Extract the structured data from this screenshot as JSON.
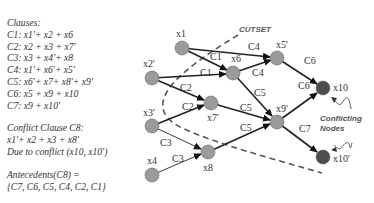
{
  "clauses": {
    "title": "Clauses:",
    "items": [
      "C1: x1'+ x2 + x6",
      "C2: x2 + x3 + x7'",
      "C3: x3 + x4'+ x8",
      "C4: x1'+ x6'+ x5'",
      "C5: x6'+ x7+ x8'+ x9'",
      "C6: x5 + x9 + x10",
      "C7: x9 + x10'"
    ]
  },
  "conflict": {
    "title": "Conflict Clause C8:",
    "clause": "x1'+ x2 + x3 + x8'",
    "reason": "Due to conflict (x10, x10')"
  },
  "antecedents": {
    "title": "Antecedents(C8) =",
    "value": "{C7, C6, C5, C4, C2, C1}"
  },
  "graph": {
    "cutset_label": "CUTSET",
    "conflicting_label_line1": "Conflicting",
    "conflicting_label_line2": "Nodes",
    "colors": {
      "node": "#9a9a9a",
      "conflict_node": "#4d4d4d",
      "edge": "#222222",
      "cutset": "#555555"
    },
    "nodes": [
      {
        "id": "x1",
        "label": "x1"
      },
      {
        "id": "x2p",
        "label": "x2'"
      },
      {
        "id": "x3p",
        "label": "x3'"
      },
      {
        "id": "x4",
        "label": "x4"
      },
      {
        "id": "x6",
        "label": "x6"
      },
      {
        "id": "x7p",
        "label": "x7'"
      },
      {
        "id": "x8",
        "label": "x8"
      },
      {
        "id": "x5p",
        "label": "x5'"
      },
      {
        "id": "x9p",
        "label": "x9'"
      },
      {
        "id": "x10",
        "label": "x10"
      },
      {
        "id": "x10p",
        "label": "x10'"
      }
    ],
    "edge_labels": {
      "x1_x6": "C1",
      "x2_x6": "C1",
      "x1_x5": "C4",
      "x6_x5": "C4",
      "x2_x7": "C2",
      "x3_x7": "C2",
      "x3_x8": "C3",
      "x4_x8": "C3",
      "x6_x9": "C5",
      "x7_x9": "C5",
      "x8_x9": "C5",
      "x5_x10": "C6",
      "x9_x10": "C6",
      "x9_x10p": "C7"
    }
  }
}
